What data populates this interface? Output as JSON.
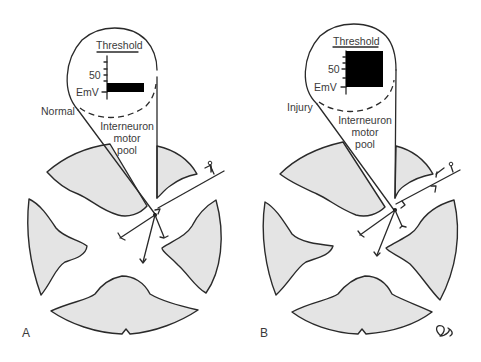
{
  "figure": {
    "panels": [
      {
        "id": "A",
        "label": "A",
        "condition_label": "Normal",
        "inset": {
          "threshold_label": "Threshold",
          "tick_label_50": "50",
          "baseline_label": "EmV",
          "response_level": "sub-threshold",
          "bar_fraction_of_threshold": 0.2
        },
        "pool_label_lines": [
          "Interneuron",
          "motor",
          "pool"
        ]
      },
      {
        "id": "B",
        "label": "B",
        "condition_label": "Injury",
        "inset": {
          "threshold_label": "Threshold",
          "tick_label_50": "50",
          "baseline_label": "EmV",
          "response_level": "reaches threshold",
          "bar_fraction_of_threshold": 1.0
        },
        "pool_label_lines": [
          "Interneuron",
          "motor",
          "pool"
        ]
      }
    ],
    "signature": "CB"
  },
  "colors": {
    "gray_matter": "#e4e4e4",
    "outline": "#2a2a2a",
    "bar": "#000000"
  }
}
